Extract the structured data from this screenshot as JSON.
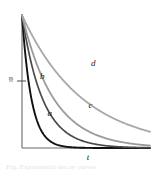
{
  "figure": {
    "title": "",
    "background_color": "#ffffff",
    "axis_color": "#6b6b6b",
    "x_axis_label": "t",
    "y_axis_tick_label": "m",
    "caption": "Fig. Exponential decay curves"
  },
  "chart_data": {
    "type": "line",
    "title": "",
    "xlabel": "t",
    "ylabel": "",
    "xlim": [
      0,
      10
    ],
    "ylim": [
      0,
      1
    ],
    "grid": false,
    "legend": "inline-curve-labels",
    "axis_ticks": {
      "y": [
        {
          "value": 0.52,
          "label": "m"
        }
      ],
      "x": []
    },
    "series": [
      {
        "name": "a",
        "label": "a",
        "color": "#111111",
        "width": 1.9,
        "decay_rate": 1.35,
        "label_x": 2.0,
        "label_y": 0.24,
        "x": [
          0,
          0.5,
          1,
          1.5,
          2,
          2.5,
          3,
          3.5,
          4,
          5,
          6,
          7,
          8,
          9,
          10
        ],
        "y": [
          1.0,
          0.51,
          0.26,
          0.132,
          0.067,
          0.034,
          0.018,
          0.009,
          0.0045,
          0.0012,
          0.0003,
          0.0001,
          0.0,
          0.0,
          0.0
        ]
      },
      {
        "name": "b",
        "label": "b",
        "color": "#4a4a4a",
        "width": 1.7,
        "decay_rate": 0.62,
        "label_x": 1.4,
        "label_y": 0.52,
        "x": [
          0,
          0.5,
          1,
          1.5,
          2,
          2.5,
          3,
          3.5,
          4,
          5,
          6,
          7,
          8,
          9,
          10
        ],
        "y": [
          1.0,
          0.733,
          0.538,
          0.394,
          0.289,
          0.212,
          0.156,
          0.114,
          0.084,
          0.045,
          0.024,
          0.013,
          0.007,
          0.004,
          0.002
        ]
      },
      {
        "name": "c",
        "label": "c",
        "color": "#9a9a9a",
        "width": 1.8,
        "decay_rate": 0.4,
        "label_x": 5.2,
        "label_y": 0.3,
        "x": [
          0,
          0.5,
          1,
          1.5,
          2,
          2.5,
          3,
          3.5,
          4,
          5,
          6,
          7,
          8,
          9,
          10
        ],
        "y": [
          1.0,
          0.819,
          0.67,
          0.549,
          0.449,
          0.368,
          0.301,
          0.247,
          0.202,
          0.135,
          0.091,
          0.061,
          0.041,
          0.027,
          0.018
        ]
      },
      {
        "name": "d",
        "label": "d",
        "color": "#a8a8a8",
        "width": 1.8,
        "decay_rate": 0.21,
        "label_x": 5.4,
        "label_y": 0.62,
        "x": [
          0,
          0.5,
          1,
          1.5,
          2,
          2.5,
          3,
          3.5,
          4,
          5,
          6,
          7,
          8,
          9,
          10
        ],
        "y": [
          1.0,
          0.9,
          0.811,
          0.73,
          0.657,
          0.591,
          0.533,
          0.479,
          0.432,
          0.35,
          0.284,
          0.23,
          0.186,
          0.151,
          0.122
        ]
      }
    ]
  }
}
